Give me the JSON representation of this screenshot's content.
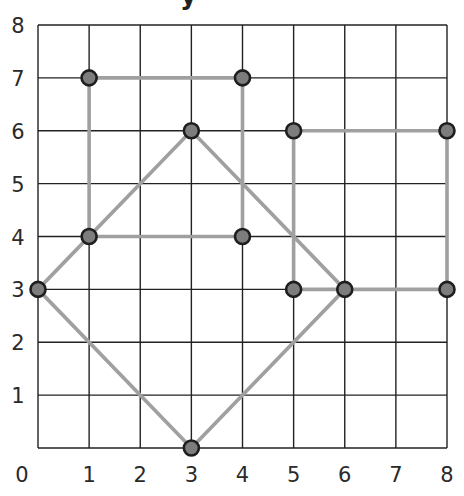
{
  "title_fragment": "y",
  "chart_data": {
    "type": "scatter",
    "title": "",
    "xlabel": "",
    "ylabel": "y",
    "xlim": [
      0,
      8
    ],
    "ylim": [
      0,
      8
    ],
    "grid": true,
    "x_ticks": [
      "0",
      "1",
      "2",
      "3",
      "4",
      "5",
      "6",
      "7",
      "8"
    ],
    "y_ticks": [
      "1",
      "2",
      "3",
      "4",
      "5",
      "6",
      "7",
      "8"
    ],
    "colors": {
      "grid": "#222222",
      "segment": "#a0a0a0",
      "point_fill": "#7d7d7d",
      "point_ring": "#1e1e1e"
    },
    "points": [
      [
        1,
        7
      ],
      [
        4,
        7
      ],
      [
        1,
        4
      ],
      [
        4,
        4
      ],
      [
        3,
        6
      ],
      [
        0,
        3
      ],
      [
        6,
        3
      ],
      [
        3,
        0
      ],
      [
        5,
        6
      ],
      [
        8,
        6
      ],
      [
        5,
        3
      ],
      [
        8,
        3
      ]
    ],
    "shapes": [
      {
        "name": "rectangle-left",
        "vertices": [
          [
            1,
            7
          ],
          [
            4,
            7
          ],
          [
            4,
            4
          ],
          [
            1,
            4
          ]
        ]
      },
      {
        "name": "square-rotated",
        "vertices": [
          [
            3,
            6
          ],
          [
            6,
            3
          ],
          [
            3,
            0
          ],
          [
            0,
            3
          ]
        ]
      },
      {
        "name": "rectangle-right",
        "vertices": [
          [
            5,
            6
          ],
          [
            8,
            6
          ],
          [
            8,
            3
          ],
          [
            5,
            3
          ]
        ]
      }
    ]
  }
}
